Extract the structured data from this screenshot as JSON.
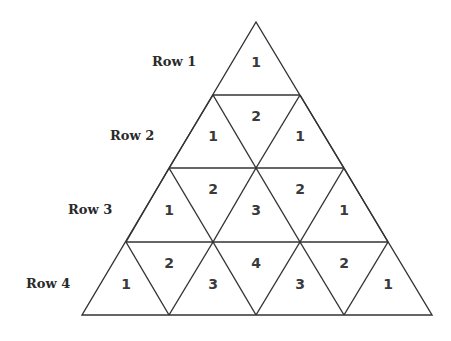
{
  "diagram": {
    "type": "triangular-number-pattern",
    "rows": [
      {
        "label": "Row 1",
        "cells": [
          "1"
        ]
      },
      {
        "label": "Row 2",
        "cells": [
          "1",
          "2",
          "1"
        ]
      },
      {
        "label": "Row 3",
        "cells": [
          "1",
          "2",
          "3",
          "2",
          "1"
        ]
      },
      {
        "label": "Row 4",
        "cells": [
          "1",
          "2",
          "3",
          "4",
          "3",
          "2",
          "1"
        ]
      }
    ],
    "colors": {
      "line": "#333333",
      "text": "#3a3a3a",
      "background": "#ffffff"
    }
  }
}
